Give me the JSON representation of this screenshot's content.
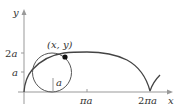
{
  "figure": {
    "axis_labels": {
      "x": "x",
      "y": "y"
    },
    "y_ticks": [
      {
        "label": "2a"
      },
      {
        "label": "a"
      }
    ],
    "x_ticks": [
      {
        "label": "πa"
      },
      {
        "label": "2πa"
      }
    ],
    "point_label": "(x, y)",
    "radius_label": "a",
    "colors": {
      "curve": "#444444",
      "axis": "#999999",
      "point": "#111111"
    }
  }
}
